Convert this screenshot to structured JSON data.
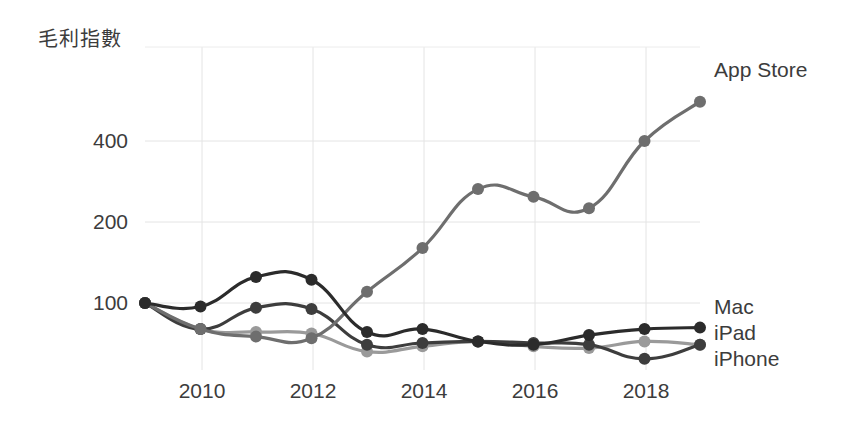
{
  "chart_data": {
    "type": "line",
    "title": "毛利指數",
    "xlabel": "",
    "ylabel": "",
    "yscale": "log",
    "ylim": [
      55,
      620
    ],
    "xlim": [
      2009,
      2019
    ],
    "grid": true,
    "legend_position": "right-inline",
    "x": [
      2009,
      2010,
      2011,
      2012,
      2013,
      2014,
      2015,
      2016,
      2017,
      2018,
      2019
    ],
    "y_ticks": [
      100,
      200,
      400
    ],
    "y_tick_labels": [
      "100",
      "200",
      "400"
    ],
    "x_ticks": [
      2010,
      2012,
      2014,
      2016,
      2018
    ],
    "x_tick_labels": [
      "2010",
      "2012",
      "2014",
      "2016",
      "2018"
    ],
    "series": [
      {
        "name": "App Store",
        "color": "#6e6e6e",
        "values": [
          100,
          80,
          75,
          74,
          110,
          160,
          265,
          248,
          225,
          400,
          560
        ]
      },
      {
        "name": "Mac",
        "color": "#2b2b2b",
        "values": [
          100,
          97,
          125,
          122,
          78,
          80,
          72,
          70,
          76,
          80,
          81
        ]
      },
      {
        "name": "iPad",
        "color": "#3d3d3d",
        "values": [
          100,
          80,
          96,
          95,
          70,
          71,
          72,
          71,
          70,
          62,
          70
        ]
      },
      {
        "name": "iPhone",
        "color": "#9a9a9a",
        "values": [
          100,
          80,
          78,
          77,
          66,
          69,
          72,
          69,
          68,
          72,
          70
        ]
      }
    ]
  },
  "legend": {
    "app_store": "App Store",
    "mac": "Mac",
    "ipad": "iPad",
    "iphone": "iPhone"
  },
  "axes": {
    "y_400": "400",
    "y_200": "200",
    "y_100": "100",
    "x_2010": "2010",
    "x_2012": "2012",
    "x_2014": "2014",
    "x_2016": "2016",
    "x_2018": "2018"
  },
  "colors": {
    "app_store": "#6e6e6e",
    "mac": "#2b2b2b",
    "ipad": "#3d3d3d",
    "iphone": "#9a9a9a",
    "grid": "#e2e2e2",
    "text": "#3c3c3c",
    "background": "#ffffff"
  }
}
